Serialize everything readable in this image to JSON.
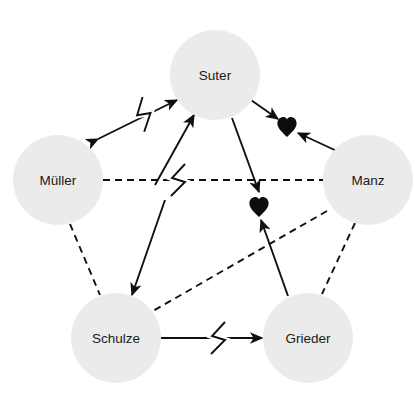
{
  "diagram": {
    "type": "sociogram",
    "title": "",
    "background_color": "#ffffff",
    "node_fill_color": "#ebebeb",
    "line_color": "#101010",
    "heart_color": "#0d0d0d",
    "node_radius": 45,
    "nodes": [
      {
        "id": "suter",
        "label": "Suter",
        "cx": 215,
        "cy": 75
      },
      {
        "id": "mueller",
        "label": "Müller",
        "cx": 58,
        "cy": 180
      },
      {
        "id": "manz",
        "label": "Manz",
        "cx": 368,
        "cy": 180
      },
      {
        "id": "schulze",
        "label": "Schulze",
        "cx": 116,
        "cy": 338
      },
      {
        "id": "grieder",
        "label": "Grieder",
        "cx": 308,
        "cy": 338
      }
    ],
    "symbols": [
      {
        "id": "heart-1",
        "name": "heart-symbol",
        "glyph": "♥",
        "cx": 287,
        "cy": 127
      },
      {
        "id": "heart-2",
        "name": "heart-symbol",
        "glyph": "♥",
        "cx": 259,
        "cy": 207
      }
    ],
    "edges": [
      {
        "id": "mueller-suter",
        "from": "mueller",
        "to": "suter",
        "style": "solid",
        "arrows": "both",
        "conflict": true,
        "x1": 98,
        "y1": 139,
        "x2": 177,
        "y2": 100,
        "bolt_x": 138,
        "bolt_y": 117
      },
      {
        "id": "suter-heart1",
        "from": "suter",
        "to": "heart-1",
        "style": "solid",
        "arrows": "forward",
        "conflict": false,
        "x1": 251,
        "y1": 100,
        "x2": 278,
        "y2": 119,
        "bolt_x": 0,
        "bolt_y": 0
      },
      {
        "id": "manz-heart1",
        "from": "manz",
        "to": "heart-1",
        "style": "solid",
        "arrows": "forward",
        "conflict": false,
        "x1": 339,
        "y1": 152,
        "x2": 298,
        "y2": 133,
        "bolt_x": 0,
        "bolt_y": 0
      },
      {
        "id": "suter-heart2",
        "from": "suter",
        "to": "heart-2",
        "style": "solid",
        "arrows": "forward",
        "conflict": false,
        "x1": 232,
        "y1": 118,
        "x2": 259,
        "y2": 192,
        "bolt_x": 0,
        "bolt_y": 0
      },
      {
        "id": "grieder-heart2",
        "from": "grieder",
        "to": "heart-2",
        "style": "solid",
        "arrows": "forward",
        "conflict": false,
        "x1": 288,
        "y1": 296,
        "x2": 261,
        "y2": 220,
        "bolt_x": 0,
        "bolt_y": 0
      },
      {
        "id": "schulze-suter",
        "from": "schulze",
        "to": "suter",
        "style": "solid",
        "arrows": "forward",
        "conflict": false,
        "x1": 155,
        "y1": 185,
        "x2": 194,
        "y2": 115,
        "bolt_x": 0,
        "bolt_y": 0
      },
      {
        "id": "suter-schulze",
        "from": "suter",
        "to": "schulze",
        "style": "solid",
        "arrows": "forward",
        "conflict": false,
        "x1": 165,
        "y1": 200,
        "x2": 132,
        "y2": 295,
        "bolt_x": 0,
        "bolt_y": 0
      },
      {
        "id": "mueller-manz",
        "from": "mueller",
        "to": "manz",
        "style": "dashed",
        "arrows": "none",
        "conflict": true,
        "x1": 103,
        "y1": 180,
        "x2": 323,
        "y2": 180,
        "bolt_x": 172,
        "bolt_y": 180
      },
      {
        "id": "mueller-schulze",
        "from": "mueller",
        "to": "schulze",
        "style": "dashed",
        "arrows": "none",
        "conflict": false,
        "x1": 70,
        "y1": 224,
        "x2": 100,
        "y2": 295,
        "bolt_x": 0,
        "bolt_y": 0
      },
      {
        "id": "manz-grieder",
        "from": "manz",
        "to": "grieder",
        "style": "dashed",
        "arrows": "none",
        "conflict": false,
        "x1": 355,
        "y1": 223,
        "x2": 322,
        "y2": 294,
        "bolt_x": 0,
        "bolt_y": 0
      },
      {
        "id": "manz-schulze",
        "from": "manz",
        "to": "schulze",
        "style": "dashed",
        "arrows": "none",
        "conflict": false,
        "x1": 327,
        "y1": 211,
        "x2": 153,
        "y2": 311,
        "bolt_x": 0,
        "bolt_y": 0
      },
      {
        "id": "schulze-grieder",
        "from": "schulze",
        "to": "grieder",
        "style": "solid",
        "arrows": "both",
        "conflict": true,
        "x1": 162,
        "y1": 338,
        "x2": 262,
        "y2": 338,
        "bolt_x": 212,
        "bolt_y": 338
      }
    ]
  }
}
